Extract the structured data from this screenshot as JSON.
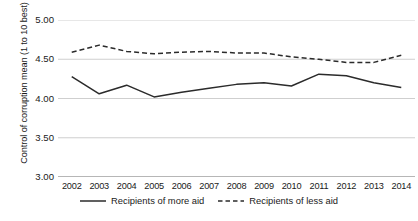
{
  "chart_data": {
    "type": "line",
    "title": "",
    "xlabel": "",
    "ylabel": "Control of corruption mean (1 to 10 best)",
    "categories": [
      "2002",
      "2003",
      "2004",
      "2005",
      "2006",
      "2007",
      "2008",
      "2009",
      "2010",
      "2011",
      "2012",
      "2013",
      "2014"
    ],
    "ylim": [
      3.0,
      5.0
    ],
    "yticks": [
      "3.00",
      "3.50",
      "4.00",
      "4.50",
      "5.00"
    ],
    "ytick_values": [
      3.0,
      3.5,
      4.0,
      4.5,
      5.0
    ],
    "grid": true,
    "legend_position": "bottom",
    "series": [
      {
        "name": "Recipients of more aid",
        "style": "solid",
        "color": "#2b2b2b",
        "values": [
          4.28,
          4.06,
          4.17,
          4.02,
          4.08,
          4.13,
          4.18,
          4.2,
          4.16,
          4.31,
          4.29,
          4.2,
          4.14
        ]
      },
      {
        "name": "Recipients of less aid",
        "style": "dashed",
        "color": "#2b2b2b",
        "values": [
          4.59,
          4.68,
          4.6,
          4.57,
          4.59,
          4.6,
          4.58,
          4.58,
          4.53,
          4.5,
          4.46,
          4.46,
          4.55
        ]
      }
    ]
  },
  "axis": {
    "y_title": "Control of corruption mean (1 to 10 best)"
  },
  "legend": {
    "items": [
      {
        "label": "Recipients of more aid",
        "style": "solid"
      },
      {
        "label": "Recipients of less aid",
        "style": "dashed"
      }
    ]
  },
  "colors": {
    "line": "#2b2b2b",
    "grid": "#c9c9c9",
    "axis": "#6f6f6f",
    "text": "#1a1a1a",
    "background": "#ffffff"
  }
}
